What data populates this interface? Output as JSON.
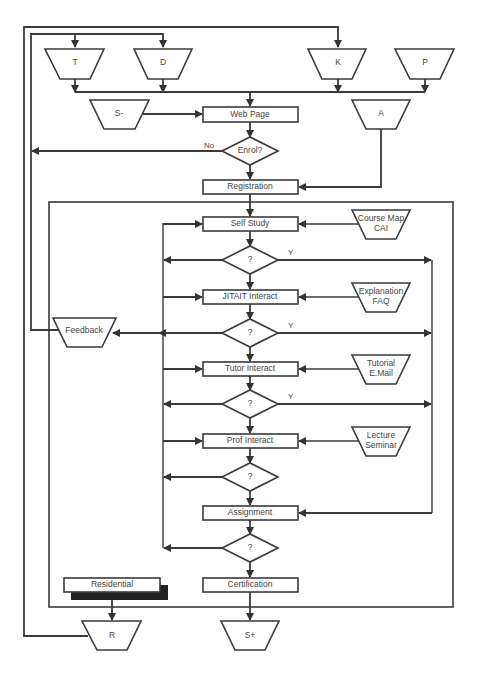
{
  "diagram": {
    "inputs": {
      "T": "T",
      "D": "D",
      "K": "K",
      "P": "P",
      "S_minus": "S-",
      "A": "A"
    },
    "process": {
      "web_page": "Web Page",
      "enrol": "Enrol?",
      "registration": "Registration",
      "self_study": "Self Study",
      "jitait": "JITAIT Interact",
      "tutor": "Tutor Interact",
      "prof": "Prof Interact",
      "assignment": "Assignment",
      "certification": "Certification",
      "residential": "Residential"
    },
    "decisions": [
      "?",
      "?",
      "?",
      "?",
      "?"
    ],
    "resources": {
      "course_map": [
        "Course Map",
        "CAI"
      ],
      "explanation": [
        "Explanation",
        "FAQ"
      ],
      "tutorial": [
        "Tutorial",
        "E.Mail"
      ],
      "lecture": [
        "Lecture",
        "Seminar"
      ]
    },
    "feedback": "Feedback",
    "outputs": {
      "R": "R",
      "S_plus": "S+"
    },
    "edge_labels": {
      "no": "No",
      "yes1": "Y",
      "yes2": "Y",
      "yes3": "Y"
    }
  }
}
